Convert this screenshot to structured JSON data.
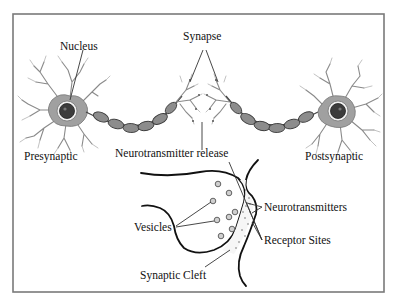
{
  "diagram": {
    "labels": {
      "nucleus": "Nucleus",
      "synapse": "Synapse",
      "presynaptic": "Presynaptic",
      "postsynaptic": "Postsynaptic",
      "neurotransmitter_release": "Neurotransmitter release",
      "neurotransmitters": "Neurotransmitters",
      "vesicles": "Vesicles",
      "receptor_sites": "Receptor Sites",
      "synaptic_cleft": "Synaptic Cleft"
    },
    "components": {
      "left_neuron": "presynaptic-neuron",
      "right_neuron": "postsynaptic-neuron",
      "axon": "myelinated-axon",
      "inset": "synaptic-terminal-closeup"
    },
    "colors": {
      "frame": "#7a7a7a",
      "cell_body": "#9a9a9a",
      "nucleus": "#3c3c3c",
      "myelin": "#8c8c8c",
      "text": "#111111"
    }
  }
}
